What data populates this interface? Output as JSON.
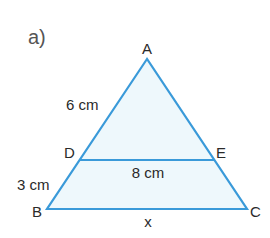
{
  "part_label": "a)",
  "colors": {
    "stroke": "#3a9ad9",
    "fill": "#eef8fc",
    "text": "#2a2a2a"
  },
  "vertices": {
    "A": {
      "label": "A",
      "x": 147,
      "y": 59
    },
    "B": {
      "label": "B",
      "x": 47,
      "y": 209
    },
    "C": {
      "label": "C",
      "x": 247,
      "y": 209
    },
    "D": {
      "label": "D",
      "x": 80,
      "y": 160
    },
    "E": {
      "label": "E",
      "x": 214,
      "y": 160
    }
  },
  "measurements": {
    "AD": "6 cm",
    "DB": "3 cm",
    "DE": "8 cm",
    "BC": "x"
  }
}
